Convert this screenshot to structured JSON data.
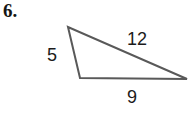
{
  "problem": {
    "number_label": "6."
  },
  "figure": {
    "name": "triangle-figure",
    "shape": "triangle",
    "stroke_color": "#595959",
    "fill_color": "#ffffff",
    "background_color": "#ffffff",
    "stroke_width": 2,
    "vertices": [
      {
        "name": "apex",
        "x": 68,
        "y": 27
      },
      {
        "name": "bottom-left",
        "x": 80,
        "y": 78
      },
      {
        "name": "bottom-right",
        "x": 187,
        "y": 79
      }
    ],
    "sides": [
      {
        "name": "left-side",
        "label": "5",
        "from": "apex",
        "to": "bottom-left"
      },
      {
        "name": "hypotenuse-side",
        "label": "12",
        "from": "apex",
        "to": "bottom-right"
      },
      {
        "name": "base-side",
        "label": "9",
        "from": "bottom-left",
        "to": "bottom-right"
      }
    ]
  }
}
